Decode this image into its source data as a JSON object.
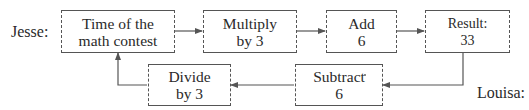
{
  "speakers": {
    "jesse": "Jesse:",
    "louisa": "Louisa:"
  },
  "jesse_steps": [
    {
      "line1": "Time of the",
      "line2": "math contest"
    },
    {
      "line1": "Multiply",
      "line2": "by 3"
    },
    {
      "line1": "Add",
      "line2": "6"
    },
    {
      "line1": "Result:",
      "line2": "33"
    }
  ],
  "louisa_steps": [
    {
      "line1": "Subtract",
      "line2": "6"
    },
    {
      "line1": "Divide",
      "line2": "by 3"
    }
  ],
  "colors": {
    "line": "#555555",
    "text": "#2a2a2a",
    "background": "#ffffff"
  }
}
